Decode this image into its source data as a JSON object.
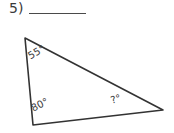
{
  "problem": {
    "number_label": "5)",
    "answer_blank_placeholder": ""
  },
  "figure": {
    "shape": "triangle",
    "stroke_color": "#333333",
    "background_color": "#ffffff",
    "vertices": {
      "top_left": {
        "x": 25,
        "y": 38
      },
      "bottom_left": {
        "x": 33,
        "y": 125
      },
      "right": {
        "x": 163,
        "y": 110
      }
    },
    "angles": [
      {
        "id": "top-left",
        "label": "55°",
        "value": 55,
        "known": true
      },
      {
        "id": "bottom-left",
        "label": "80°",
        "value": 80,
        "known": true
      },
      {
        "id": "right",
        "label": "?°",
        "value": null,
        "known": false
      }
    ]
  }
}
